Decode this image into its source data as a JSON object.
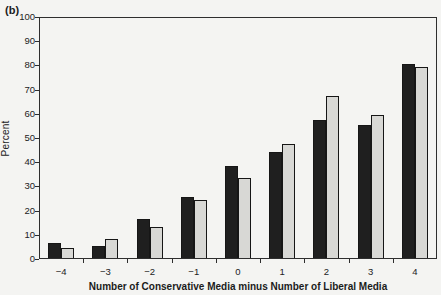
{
  "figure": {
    "panel_label": "(b)",
    "background_color": "#f4f4f2"
  },
  "chart_data": {
    "type": "bar",
    "title": "",
    "xlabel": "Number of Conservative Media minus Number of Liberal Media",
    "ylabel": "Percent",
    "categories": [
      "−4",
      "−3",
      "−2",
      "−1",
      "0",
      "1",
      "2",
      "3",
      "4"
    ],
    "series": [
      {
        "name": "black-bars",
        "color": "#1f1f1f",
        "values": [
          6,
          5,
          16,
          25,
          38,
          44,
          57,
          55,
          80
        ]
      },
      {
        "name": "gray-bars",
        "color": "#d8d8d5",
        "values": [
          4,
          8,
          13,
          24,
          33,
          47,
          67,
          59,
          79
        ]
      }
    ],
    "ylim": [
      0,
      100
    ],
    "yticks": [
      0,
      10,
      20,
      30,
      40,
      50,
      60,
      70,
      80,
      90,
      100
    ],
    "grid": false,
    "legend": "none",
    "bar_outline_color": "#161616"
  }
}
